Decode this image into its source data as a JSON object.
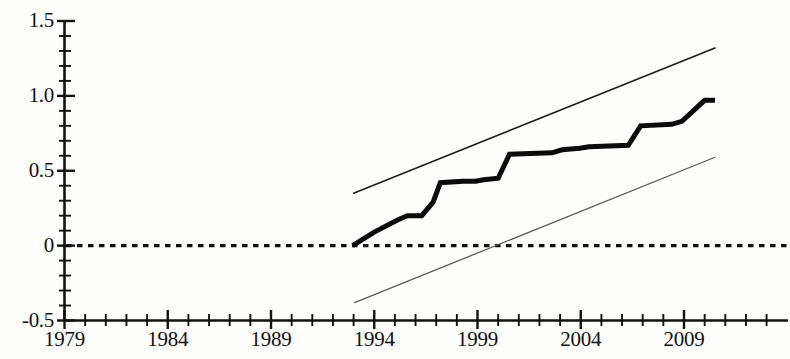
{
  "chart_data": {
    "type": "line",
    "title": "",
    "subtitle": "",
    "xlabel": "",
    "ylabel": "",
    "xlim": [
      1979,
      2012.2
    ],
    "ylim": [
      -0.5,
      1.5
    ],
    "grid": false,
    "legend_position": "none",
    "zero_reference_line": {
      "value": 0,
      "style": "dotted",
      "color": "#111111"
    },
    "x_ticks_major": [
      1979,
      1984,
      1989,
      1994,
      1999,
      2004,
      2009
    ],
    "x_tick_labels": [
      "1979",
      "1984",
      "1989",
      "1994",
      "1999",
      "2004",
      "2009"
    ],
    "x_ticks_minor_step": 1,
    "y_ticks_major": [
      -0.5,
      0,
      0.5,
      1.0,
      1.5
    ],
    "y_tick_labels": [
      "-0.5",
      "0",
      "0.5",
      "1.0",
      "1.5"
    ],
    "y_ticks_minor_step": 0.1,
    "series": [
      {
        "name": "upper-confidence-bound",
        "style": "thin-solid",
        "color": "#1d1d1d",
        "width": 1.6,
        "x": [
          1993.0,
          2010.5
        ],
        "values": [
          0.35,
          1.32
        ]
      },
      {
        "name": "estimate",
        "style": "thick-step",
        "color": "#0b0b0b",
        "width": 5.0,
        "x": [
          1992.95,
          1994.0,
          1995.1,
          1995.6,
          1996.3,
          1996.85,
          1997.2,
          1998.3,
          1998.9,
          1999.3,
          2000.0,
          2000.55,
          2002.6,
          2003.1,
          2003.95,
          2004.4,
          2006.3,
          2006.9,
          2008.4,
          2008.9,
          2010.0,
          2010.5
        ],
        "values": [
          0.0,
          0.09,
          0.17,
          0.2,
          0.2,
          0.29,
          0.42,
          0.43,
          0.43,
          0.44,
          0.45,
          0.61,
          0.62,
          0.64,
          0.65,
          0.66,
          0.67,
          0.8,
          0.81,
          0.83,
          0.97,
          0.97
        ]
      },
      {
        "name": "lower-confidence-bound",
        "style": "thin-solid-light",
        "color": "#5a5a5a",
        "width": 1.3,
        "x": [
          1993.05,
          2010.5
        ],
        "values": [
          -0.38,
          0.59
        ]
      }
    ],
    "annotations": []
  },
  "axes": {
    "y_labels": [
      {
        "text": "1.5",
        "value": 1.5
      },
      {
        "text": "1.0",
        "value": 1.0
      },
      {
        "text": "0.5",
        "value": 0.5
      },
      {
        "text": "0",
        "value": 0
      },
      {
        "text": "-0.5",
        "value": -0.5
      }
    ],
    "x_labels": [
      {
        "text": "1979",
        "value": 1979
      },
      {
        "text": "1984",
        "value": 1984
      },
      {
        "text": "1989",
        "value": 1989
      },
      {
        "text": "1994",
        "value": 1994
      },
      {
        "text": "1999",
        "value": 1999
      },
      {
        "text": "2004",
        "value": 2004
      },
      {
        "text": "2009",
        "value": 2009
      }
    ]
  }
}
